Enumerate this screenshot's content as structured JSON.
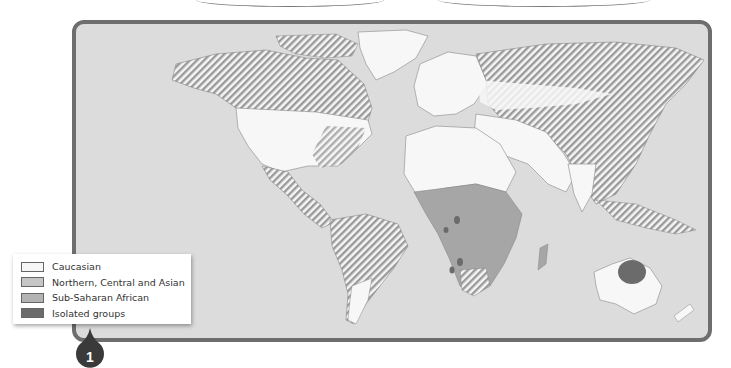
{
  "map": {
    "title_lines": 2,
    "colors": {
      "ocean": "#dcdcdc",
      "frame": "#6e6e6e",
      "caucasian": "#f7f7f7",
      "northern_central_asian": "#bfbfbf",
      "sub_saharan_african": "#a6a6a6",
      "isolated_groups": "#6b6b6b",
      "hatch": "#9a9a9a"
    }
  },
  "legend": {
    "items": [
      {
        "label": "Caucasian",
        "color": "#f7f7f7"
      },
      {
        "label": "Northern, Central and Asian",
        "color": "#c6c6c6"
      },
      {
        "label": "Sub-Saharan African",
        "color": "#b3b3b3"
      },
      {
        "label": "Isolated groups",
        "color": "#6b6b6b"
      }
    ]
  },
  "badge": {
    "number": "1",
    "color": "#3a3a3a"
  }
}
